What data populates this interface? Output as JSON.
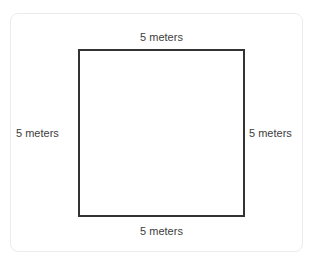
{
  "page": {
    "clipped_top_text": "",
    "background_color": "#ffffff"
  },
  "card": {
    "border_color": "#ececef",
    "background_color": "#ffffff"
  },
  "diagram": {
    "type": "square",
    "shape_name": "square",
    "stroke_color": "#333333",
    "fill_color": "transparent",
    "unit": "meters",
    "side_length": 5,
    "labels": {
      "top": "5 meters",
      "right": "5 meters",
      "bottom": "5 meters",
      "left": "5 meters"
    }
  }
}
